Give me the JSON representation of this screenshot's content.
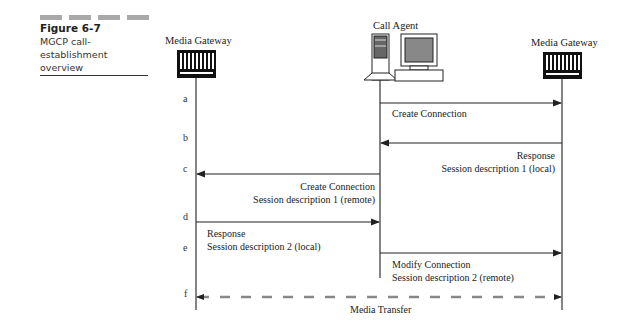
{
  "figure": {
    "number": "Figure 6-7",
    "caption": "MGCP call-establishment overview"
  },
  "entities": {
    "left_gateway": "Media Gateway",
    "call_agent": "Call Agent",
    "right_gateway": "Media Gateway"
  },
  "steps": [
    "a",
    "b",
    "c",
    "d",
    "e",
    "f"
  ],
  "messages": [
    {
      "step": "a",
      "from": "Call Agent",
      "to": "Media Gateway (right)",
      "lines": [
        "Create Connection"
      ]
    },
    {
      "step": "b",
      "from": "Media Gateway (right)",
      "to": "Call Agent",
      "lines": [
        "Response",
        "Session description 1 (local)"
      ]
    },
    {
      "step": "c",
      "from": "Call Agent",
      "to": "Media Gateway (left)",
      "lines": [
        "Create Connection",
        "Session description 1 (remote)"
      ]
    },
    {
      "step": "d",
      "from": "Media Gateway (left)",
      "to": "Call Agent",
      "lines": [
        "Response",
        "Session description 2 (local)"
      ]
    },
    {
      "step": "e",
      "from": "Call Agent",
      "to": "Media Gateway (right)",
      "lines": [
        "Modify Connection",
        "Session description 2 (remote)"
      ]
    },
    {
      "step": "f",
      "from": "Media Gateway (left)",
      "to": "Media Gateway (right)",
      "style": "dashed-bidirectional",
      "lines": [
        "Media Transfer"
      ]
    }
  ],
  "colors": {
    "line": "#333333",
    "media_dash": "#888888",
    "caption_bar": "#a9a9a9"
  }
}
